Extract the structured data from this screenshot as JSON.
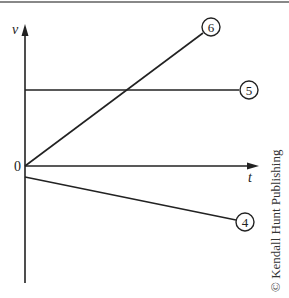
{
  "figure": {
    "axes": {
      "y_label": "v",
      "x_label": "t",
      "origin_label": "0"
    },
    "lines": [
      {
        "id": "6",
        "label": "6",
        "description": "straight line starting at origin with positive slope"
      },
      {
        "id": "5",
        "label": "5",
        "description": "horizontal line at constant positive v"
      },
      {
        "id": "4",
        "label": "4",
        "description": "straight line starting slightly below zero with negative slope"
      }
    ],
    "credit": "© Kendall Hunt Publishing",
    "colors": {
      "ink": "#222222",
      "top_rule": "#888888",
      "background": "#ffffff"
    }
  }
}
